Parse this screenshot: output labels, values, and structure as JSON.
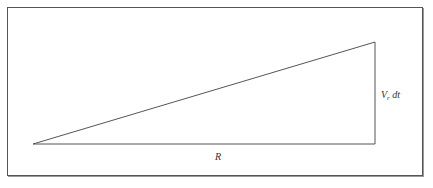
{
  "diagram": {
    "type": "right-triangle",
    "vertices": {
      "left": [
        33,
        144
      ],
      "bottom_right": [
        375,
        144
      ],
      "top_right": [
        375,
        42
      ]
    },
    "labels": {
      "vertical_side": {
        "main": "V",
        "subscript": "r",
        "suffix": " dt"
      },
      "base": "R"
    },
    "stroke_color": "#555555",
    "frame_color": "#555555"
  }
}
